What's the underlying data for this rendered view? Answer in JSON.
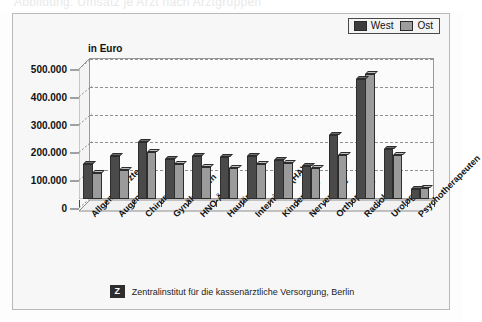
{
  "top_headline_ghost": "Abbildung: Umsatz je Arzt nach Arztgruppen",
  "legend": {
    "items": [
      {
        "label": "West",
        "color": "#3d3d3d"
      },
      {
        "label": "Ost",
        "color": "#9d9d9d"
      }
    ]
  },
  "axis_title": "in Euro",
  "footer": {
    "logo_glyph": "Z",
    "logo_name": "zi-logo-icon",
    "text": "Zentralinstitut für die kassenärztliche Versorgung, Berlin"
  },
  "chart_data": {
    "type": "bar",
    "title": "",
    "subtitle": "",
    "xlabel": "",
    "ylabel": "in Euro",
    "ylim": [
      0,
      500000
    ],
    "yticks": [
      "0",
      "100.000",
      "200.000",
      "300.000",
      "400.000",
      "500.000"
    ],
    "ytick_values": [
      0,
      100000,
      200000,
      300000,
      400000,
      500000
    ],
    "grid": true,
    "legend_position": "top-right",
    "categories": [
      "Allgemeinärzte",
      "Augenärzte",
      "Chirurgen",
      "Gynäkologen",
      "HNO-Ärzte",
      "Hautärzte",
      "Internisten (HA)",
      "Kinderärzte",
      "Nervenärzte",
      "Orthopäden",
      "Radiologen",
      "Urologen",
      "Psychotherapeuten"
    ],
    "series": [
      {
        "name": "West",
        "color": "#4a4a4a",
        "values": [
          125000,
          155000,
          205000,
          145000,
          155000,
          150000,
          155000,
          140000,
          120000,
          230000,
          430000,
          180000,
          35000
        ]
      },
      {
        "name": "Ost",
        "color": "#9b9b9b",
        "values": [
          95000,
          105000,
          170000,
          125000,
          115000,
          110000,
          125000,
          130000,
          110000,
          160000,
          450000,
          160000,
          40000
        ]
      }
    ]
  }
}
